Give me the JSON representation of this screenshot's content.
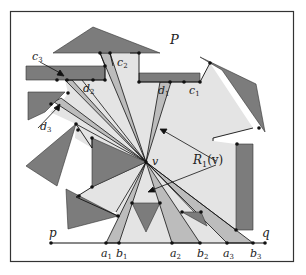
{
  "figure": {
    "polygon_label": "P",
    "point_v": "v",
    "region_label": "R",
    "region_sub": "1",
    "region_arg": "(v)",
    "endpoint_p": "p",
    "endpoint_q": "q",
    "baseline_points": [
      {
        "base": "a",
        "sub": "1"
      },
      {
        "base": "b",
        "sub": "1"
      },
      {
        "base": "a",
        "sub": "2"
      },
      {
        "base": "b",
        "sub": "2"
      },
      {
        "base": "a",
        "sub": "3"
      },
      {
        "base": "b",
        "sub": "3"
      }
    ],
    "edge_labels": [
      {
        "base": "c",
        "sub": "1"
      },
      {
        "base": "d",
        "sub": "1"
      },
      {
        "base": "c",
        "sub": "2"
      },
      {
        "base": "d",
        "sub": "2"
      },
      {
        "base": "c",
        "sub": "3"
      },
      {
        "base": "d",
        "sub": "3"
      }
    ]
  },
  "colors": {
    "frame": "#333333",
    "obstacle": "#7a7a7a",
    "visibility_region": "#e2e2e2",
    "wedge": "#bdbdbd",
    "edge": "#111111",
    "background": "#ffffff"
  }
}
